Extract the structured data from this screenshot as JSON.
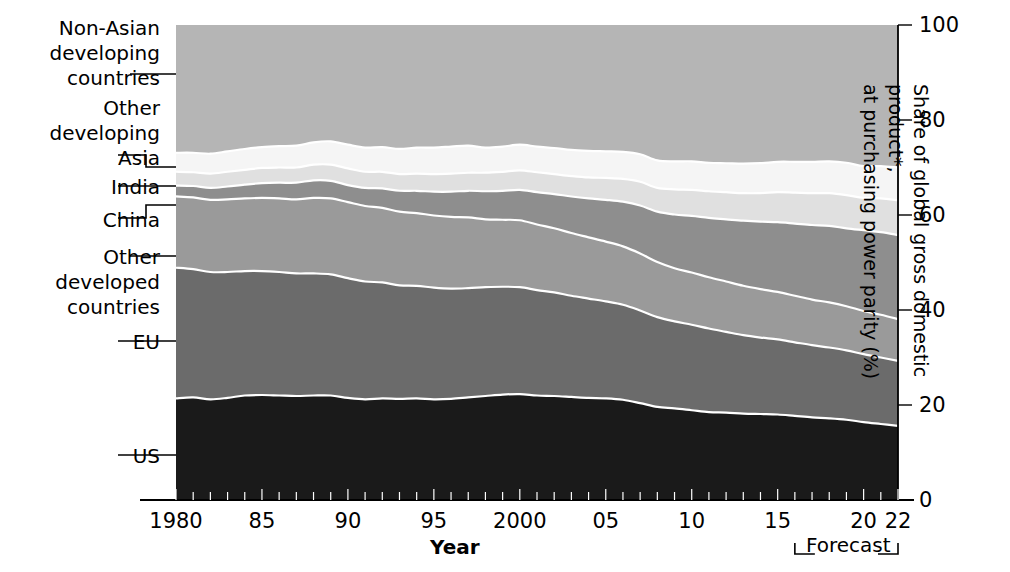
{
  "chart_data": {
    "type": "area",
    "title": "",
    "xlabel": "Year",
    "ylabel": "Share of global gross domestic product*, at purchasing power parity (%)",
    "ylim": [
      0,
      100
    ],
    "xlim": [
      1980,
      2022
    ],
    "ytick_labels": [
      "0",
      "20",
      "40",
      "60",
      "80",
      "100"
    ],
    "ytick_values": [
      0,
      20,
      40,
      60,
      80,
      100
    ],
    "xtick_labels": [
      "1980",
      "85",
      "90",
      "95",
      "2000",
      "05",
      "10",
      "15",
      "20",
      "22"
    ],
    "xtick_values": [
      1980,
      1985,
      1990,
      1995,
      2000,
      2005,
      2010,
      2015,
      2020,
      2022
    ],
    "grid": false,
    "legend_position": "left-leader-labels",
    "stacked": true,
    "forecast": {
      "label": "Forecast",
      "start": 2016,
      "end": 2022
    },
    "x": [
      1980,
      1981,
      1982,
      1983,
      1984,
      1985,
      1986,
      1987,
      1988,
      1989,
      1990,
      1991,
      1992,
      1993,
      1994,
      1995,
      1996,
      1997,
      1998,
      1999,
      2000,
      2001,
      2002,
      2003,
      2004,
      2005,
      2006,
      2007,
      2008,
      2009,
      2010,
      2011,
      2012,
      2013,
      2014,
      2015,
      2016,
      2017,
      2018,
      2019,
      2020,
      2021,
      2022
    ],
    "series": [
      {
        "name": "US",
        "color": "#1a1a1a",
        "values": [
          21.4,
          21.6,
          21.2,
          21.5,
          22.0,
          22.1,
          22.0,
          21.9,
          22.0,
          22.0,
          21.5,
          21.2,
          21.4,
          21.3,
          21.4,
          21.2,
          21.3,
          21.6,
          21.9,
          22.2,
          22.3,
          22.0,
          21.9,
          21.7,
          21.5,
          21.4,
          21.1,
          20.4,
          19.6,
          19.3,
          18.9,
          18.5,
          18.4,
          18.2,
          18.1,
          18.0,
          17.7,
          17.4,
          17.2,
          16.9,
          16.4,
          16.0,
          15.6
        ]
      },
      {
        "name": "EU",
        "color": "#6b6b6b",
        "values": [
          27.5,
          27.0,
          26.8,
          26.5,
          26.2,
          26.1,
          26.0,
          25.8,
          25.7,
          25.5,
          25.2,
          24.8,
          24.4,
          23.9,
          23.7,
          23.5,
          23.2,
          23.0,
          22.9,
          22.7,
          22.5,
          22.2,
          21.8,
          21.3,
          20.9,
          20.4,
          20.0,
          19.5,
          18.9,
          18.3,
          18.0,
          17.6,
          17.0,
          16.5,
          16.1,
          15.8,
          15.5,
          15.2,
          14.9,
          14.6,
          14.3,
          14.0,
          13.7
        ]
      },
      {
        "name": "Other developed countries",
        "color": "#9a9a9a",
        "values": [
          15.0,
          15.1,
          15.2,
          15.3,
          15.3,
          15.4,
          15.5,
          15.6,
          15.9,
          16.0,
          16.0,
          15.9,
          15.7,
          15.5,
          15.3,
          15.2,
          15.1,
          14.9,
          14.3,
          14.1,
          14.1,
          13.8,
          13.5,
          13.2,
          12.9,
          12.6,
          12.3,
          12.0,
          11.6,
          11.2,
          11.0,
          10.8,
          10.6,
          10.4,
          10.2,
          10.0,
          9.8,
          9.6,
          9.5,
          9.3,
          9.1,
          9.0,
          8.8
        ]
      },
      {
        "name": "China",
        "color": "#8e8e8e",
        "values": [
          2.3,
          2.4,
          2.5,
          2.7,
          2.9,
          3.1,
          3.3,
          3.5,
          3.7,
          3.7,
          3.6,
          3.8,
          4.1,
          4.4,
          4.7,
          5.0,
          5.3,
          5.6,
          5.9,
          6.1,
          6.4,
          6.8,
          7.2,
          7.7,
          8.2,
          8.8,
          9.4,
          10.1,
          10.6,
          11.3,
          11.9,
          12.5,
          13.1,
          13.7,
          14.2,
          14.7,
          15.2,
          15.7,
          16.1,
          16.4,
          17.0,
          17.4,
          17.7
        ]
      },
      {
        "name": "India",
        "color": "#e0e0e0",
        "values": [
          2.9,
          2.9,
          3.0,
          3.1,
          3.1,
          3.2,
          3.2,
          3.2,
          3.3,
          3.4,
          3.5,
          3.4,
          3.5,
          3.5,
          3.6,
          3.7,
          3.8,
          3.8,
          3.9,
          4.0,
          4.1,
          4.2,
          4.2,
          4.3,
          4.4,
          4.6,
          4.8,
          5.0,
          5.0,
          5.3,
          5.5,
          5.6,
          5.7,
          5.8,
          6.0,
          6.3,
          6.5,
          6.7,
          6.9,
          7.0,
          6.8,
          7.1,
          7.3
        ]
      },
      {
        "name": "Other developing Asia",
        "color": "#f5f5f5",
        "values": [
          4.0,
          4.1,
          4.2,
          4.3,
          4.4,
          4.4,
          4.5,
          4.6,
          4.7,
          4.9,
          5.0,
          5.1,
          5.2,
          5.3,
          5.5,
          5.6,
          5.7,
          5.7,
          5.3,
          5.3,
          5.4,
          5.4,
          5.5,
          5.5,
          5.6,
          5.6,
          5.7,
          5.8,
          5.8,
          5.9,
          6.0,
          6.0,
          6.1,
          6.2,
          6.3,
          6.4,
          6.5,
          6.6,
          6.7,
          6.8,
          6.7,
          6.8,
          6.9
        ]
      },
      {
        "name": "Non-Asian developing countries",
        "color": "#b5b5b5",
        "values": [
          26.9,
          26.9,
          27.1,
          26.6,
          26.1,
          25.7,
          25.5,
          25.4,
          24.7,
          24.5,
          25.2,
          25.8,
          25.7,
          26.1,
          25.8,
          25.8,
          25.6,
          25.4,
          25.8,
          25.6,
          25.2,
          25.6,
          25.9,
          26.3,
          26.5,
          26.6,
          26.7,
          27.2,
          28.5,
          28.7,
          28.7,
          29.0,
          29.1,
          29.2,
          29.1,
          28.8,
          28.8,
          28.8,
          28.7,
          29.0,
          29.7,
          29.7,
          30.0
        ]
      }
    ],
    "leader_labels": [
      {
        "id": "non-asian-developing-countries",
        "lines": [
          "Non-Asian",
          "developing",
          "countries"
        ]
      },
      {
        "id": "other-developing-asia",
        "lines": [
          "Other",
          "developing",
          "Asia"
        ]
      },
      {
        "id": "india",
        "lines": [
          "India"
        ]
      },
      {
        "id": "china",
        "lines": [
          "China"
        ]
      },
      {
        "id": "other-developed-countries",
        "lines": [
          "Other",
          "developed",
          "countries"
        ]
      },
      {
        "id": "eu",
        "lines": [
          "EU"
        ]
      },
      {
        "id": "us",
        "lines": [
          "US"
        ]
      }
    ]
  },
  "labels": {
    "non_asian_l1": "Non-Asian",
    "non_asian_l2": "developing",
    "non_asian_l3": "countries",
    "other_dev_asia_l1": "Other",
    "other_dev_asia_l2": "developing",
    "other_dev_asia_l3": "Asia",
    "india": "India",
    "china": "China",
    "other_developed_l1": "Other",
    "other_developed_l2": "developed",
    "other_developed_l3": "countries",
    "eu": "EU",
    "us": "US"
  },
  "axes": {
    "x_title": "Year",
    "y_title_line1": "Share of global gross domestic product*,",
    "y_title_line2": "at purchasing power parity (%)",
    "forecast_label": "Forecast",
    "y_ticks": [
      "100",
      "80",
      "60",
      "40",
      "20",
      "0"
    ],
    "x_ticks": [
      "1980",
      "85",
      "90",
      "95",
      "2000",
      "05",
      "10",
      "15",
      "20",
      "22"
    ]
  }
}
